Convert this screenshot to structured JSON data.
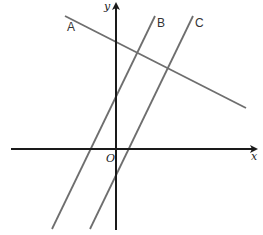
{
  "diagram": {
    "type": "coordinate-plane",
    "axes": {
      "x_label": "x",
      "y_label": "y",
      "origin_label": "O"
    },
    "lines": [
      {
        "label": "A",
        "description": "line with negative slope, crossing the positive y-axis"
      },
      {
        "label": "B",
        "description": "line with positive slope, crossing the positive y-axis and negative x-axis"
      },
      {
        "label": "C",
        "description": "line with positive slope parallel to B, crossing the negative y-axis and positive x-axis"
      }
    ],
    "colors": {
      "axis": "#1a1a1a",
      "lines": "#6e6e6e",
      "background": "#ffffff"
    }
  }
}
